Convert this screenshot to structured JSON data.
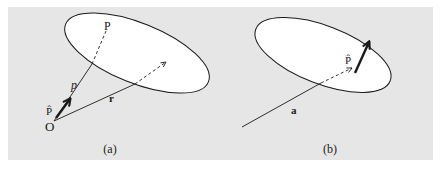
{
  "figure": {
    "background": "#e6e6e6",
    "ellipse_fill": "#ffffff",
    "stroke_color": "#1a1a1a",
    "panels": [
      {
        "caption": "(a)",
        "labels": {
          "origin": "O",
          "point": "P",
          "unit_vector": "P̂",
          "p_vector": "p",
          "r_vector": "r"
        }
      },
      {
        "caption": "(b)",
        "labels": {
          "unit_vector": "P̂",
          "a_vector": "a"
        }
      }
    ]
  }
}
